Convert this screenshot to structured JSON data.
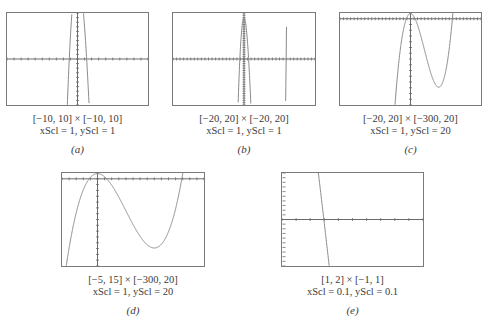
{
  "function_note": "cubic polynomial graphed in five viewing windows",
  "panels": [
    {
      "id": "a",
      "tag": "(a)",
      "window": "[−10, 10] × [−10, 10]",
      "scale": "xScl = 1, yScl = 1",
      "xmin": -10,
      "xmax": 10,
      "ymin": -10,
      "ymax": 10,
      "xscl": 1,
      "yscl": 1,
      "box": {
        "x": 6,
        "y": 12,
        "w": 143,
        "h": 94
      }
    },
    {
      "id": "b",
      "tag": "(b)",
      "window": "[−20, 20] × [−20, 20]",
      "scale": "xScl = 1, yScl = 1",
      "xmin": -20,
      "xmax": 20,
      "ymin": -20,
      "ymax": 20,
      "xscl": 1,
      "yscl": 1,
      "box": {
        "x": 172,
        "y": 12,
        "w": 144,
        "h": 94
      }
    },
    {
      "id": "c",
      "tag": "(c)",
      "window": "[−20, 20] × [−300, 20]",
      "scale": "xScl = 1, yScl = 20",
      "xmin": -20,
      "xmax": 20,
      "ymin": -300,
      "ymax": 20,
      "xscl": 1,
      "yscl": 20,
      "box": {
        "x": 339,
        "y": 12,
        "w": 143,
        "h": 94
      }
    },
    {
      "id": "d",
      "tag": "(d)",
      "window": "[−5, 15] × [−300, 20]",
      "scale": "xScl = 1, yScl = 20",
      "xmin": -5,
      "xmax": 15,
      "ymin": -300,
      "ymax": 20,
      "xscl": 1,
      "yscl": 20,
      "box": {
        "x": 61,
        "y": 172,
        "w": 144,
        "h": 95
      }
    },
    {
      "id": "e",
      "tag": "(e)",
      "window": "[1, 2] × [−1, 1]",
      "scale": "xScl = 0.1, yScl = 0.1",
      "xmin": 1,
      "xmax": 2,
      "ymin": -1,
      "ymax": 1,
      "xscl": 0.1,
      "yscl": 0.1,
      "box": {
        "x": 281,
        "y": 172,
        "w": 143,
        "h": 95
      }
    }
  ],
  "colors": {
    "frame": "#7a7a7a",
    "axis": "#6a6a6a",
    "curve": "#8a8a8a",
    "text": "#3a3a3a"
  },
  "chart_data": [
    {
      "type": "line",
      "title": "(a)",
      "xlabel": "[−10, 10] × [−10, 10]",
      "ylabel": "xScl = 1, yScl = 1",
      "xlim": [
        -10,
        10
      ],
      "ylim": [
        -10,
        10
      ],
      "grid": false,
      "series": [
        {
          "name": "y = f(x) cubic",
          "x": [
            -1.3,
            -1.2,
            0,
            1.2,
            1.3
          ],
          "values": [
            -10,
            -1,
            18,
            1,
            -10
          ]
        }
      ]
    },
    {
      "type": "line",
      "title": "(b)",
      "xlabel": "[−20, 20] × [−20, 20]",
      "ylabel": "xScl = 1, yScl = 1",
      "xlim": [
        -20,
        20
      ],
      "ylim": [
        -20,
        20
      ],
      "grid": false,
      "series": [
        {
          "name": "y = f(x) cubic",
          "x": [
            -1.4,
            0,
            1.4,
            11.9,
            12
          ],
          "values": [
            -20,
            18,
            -20,
            -20,
            20
          ]
        }
      ]
    },
    {
      "type": "line",
      "title": "(c)",
      "xlabel": "[−20, 20] × [−300, 20]",
      "ylabel": "xScl = 1, yScl = 20",
      "xlim": [
        -20,
        20
      ],
      "ylim": [
        -300,
        20
      ],
      "grid": false,
      "series": [
        {
          "name": "y = f(x) cubic",
          "x": [
            -4.5,
            0,
            8,
            12.2
          ],
          "values": [
            -300,
            18,
            -238,
            20
          ]
        }
      ]
    },
    {
      "type": "line",
      "title": "(d)",
      "xlabel": "[−5, 15] × [−300, 20]",
      "ylabel": "xScl = 1, yScl = 20",
      "xlim": [
        -5,
        15
      ],
      "ylim": [
        -300,
        20
      ],
      "grid": false,
      "series": [
        {
          "name": "y = f(x) cubic",
          "x": [
            -4.5,
            -1.2,
            0,
            1.3,
            8,
            11.9,
            12.2
          ],
          "values": [
            -300,
            0,
            18,
            0,
            -238,
            0,
            20
          ]
        }
      ]
    },
    {
      "type": "line",
      "title": "(e)",
      "xlabel": "[1, 2] × [−1, 1]",
      "ylabel": "xScl = 0.1, yScl = 0.1",
      "xlim": [
        1,
        2
      ],
      "ylim": [
        -1,
        1
      ],
      "grid": false,
      "series": [
        {
          "name": "y = f(x) cubic",
          "x": [
            1.25,
            1.3,
            1.33
          ],
          "values": [
            1,
            0,
            -1
          ]
        }
      ]
    }
  ]
}
